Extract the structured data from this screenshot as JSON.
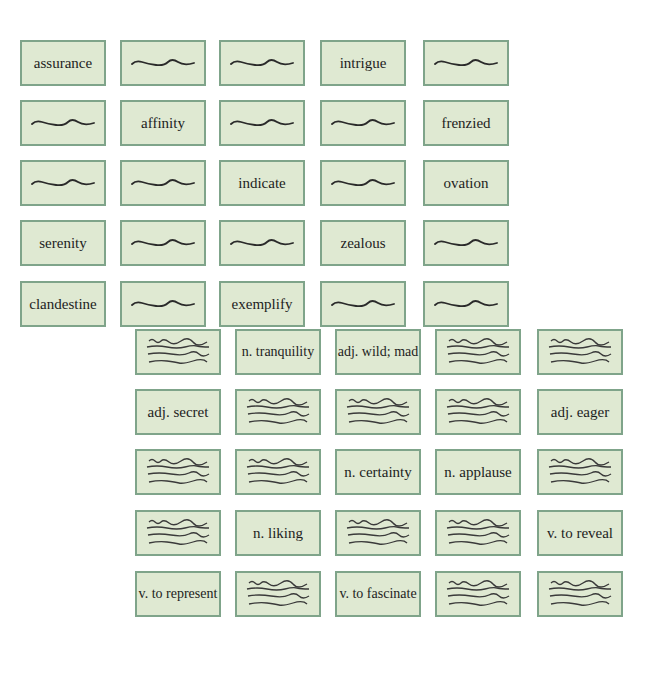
{
  "colors": {
    "card_fill": "#dfe9d2",
    "card_border": "#7fa48a",
    "text": "#1d1d1d",
    "scribble": "#2a2a2a"
  },
  "top_grid": {
    "rows": [
      [
        "assurance",
        "",
        "",
        "intrigue",
        ""
      ],
      [
        "",
        "affinity",
        "",
        "",
        "frenzied"
      ],
      [
        "",
        "",
        "indicate",
        "",
        "ovation"
      ],
      [
        "serenity",
        "",
        "",
        "zealous",
        ""
      ],
      [
        "clandestine",
        "",
        "exemplify",
        "",
        ""
      ]
    ],
    "blank_icon": "single-wavy-line"
  },
  "bottom_grid": {
    "rows": [
      [
        "",
        "n. tranquility",
        "adj. wild; mad",
        "",
        ""
      ],
      [
        "adj. secret",
        "",
        "",
        "",
        "adj. eager"
      ],
      [
        "",
        "",
        "n. certainty",
        "n. applause",
        ""
      ],
      [
        "",
        "n. liking",
        "",
        "",
        "v. to reveal"
      ],
      [
        "v. to represent",
        "",
        "v. to fascinate",
        "",
        ""
      ]
    ],
    "blank_icon": "four-wavy-lines"
  }
}
